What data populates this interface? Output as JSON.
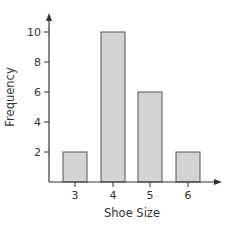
{
  "chart_data": {
    "type": "bar",
    "title": "",
    "xlabel": "Shoe Size",
    "ylabel": "Frequency",
    "categories": [
      "3",
      "4",
      "5",
      "6"
    ],
    "values": [
      2,
      10,
      6,
      2
    ],
    "yticks": [
      "2",
      "4",
      "6",
      "8",
      "10"
    ],
    "ylim": [
      0,
      11
    ],
    "grid": false,
    "legend": null,
    "bar_fill": "#d3d3d3",
    "bar_stroke": "#555555",
    "axis_color": "#333333"
  }
}
